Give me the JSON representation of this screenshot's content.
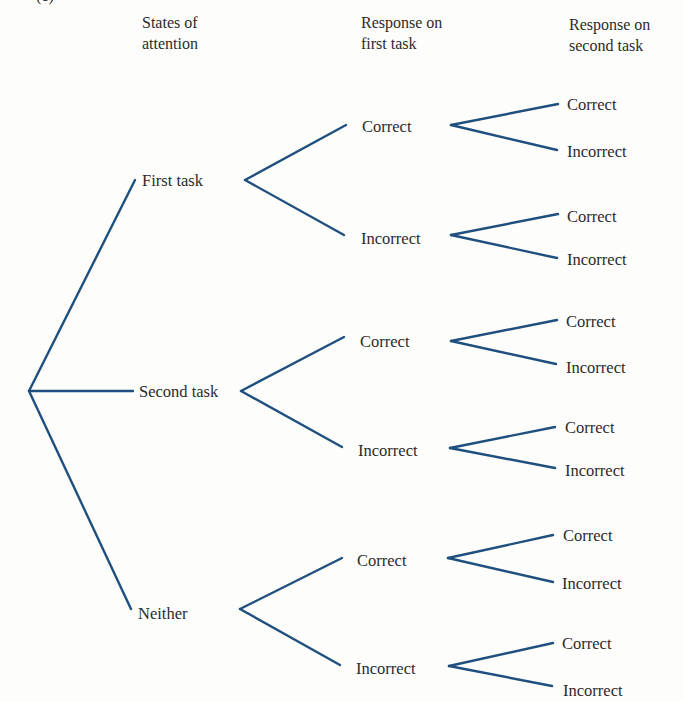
{
  "figure": {
    "panel_label": "(c)",
    "line_color": "#1f4f7e",
    "text_color": "#2b2b2b",
    "background": "#fdfdfb"
  },
  "headers": {
    "states": [
      "States of",
      "attention"
    ],
    "first_response": [
      "Response on",
      "first task"
    ],
    "second_response": [
      "Response on",
      "second task"
    ]
  },
  "tree": {
    "root": "",
    "states": [
      {
        "label": "First task",
        "first_task": [
          {
            "label": "Correct",
            "second_task": [
              "Correct",
              "Incorrect"
            ]
          },
          {
            "label": "Incorrect",
            "second_task": [
              "Correct",
              "Incorrect"
            ]
          }
        ]
      },
      {
        "label": "Second task",
        "first_task": [
          {
            "label": "Correct",
            "second_task": [
              "Correct",
              "Incorrect"
            ]
          },
          {
            "label": "Incorrect",
            "second_task": [
              "Correct",
              "Incorrect"
            ]
          }
        ]
      },
      {
        "label": "Neither",
        "first_task": [
          {
            "label": "Correct",
            "second_task": [
              "Correct",
              "Incorrect"
            ]
          },
          {
            "label": "Incorrect",
            "second_task": [
              "Correct",
              "Incorrect"
            ]
          }
        ]
      }
    ]
  }
}
